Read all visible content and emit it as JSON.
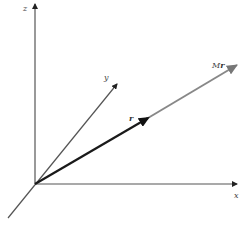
{
  "diagram": {
    "title": "",
    "origin": [
      35,
      184
    ],
    "axes": [
      {
        "name": "z",
        "label": "z",
        "from": [
          35,
          184
        ],
        "to": [
          35,
          3
        ],
        "label_pos": [
          23,
          11
        ],
        "color": "#555555"
      },
      {
        "name": "x",
        "label": "x",
        "from": [
          35,
          184
        ],
        "to": [
          238,
          184
        ],
        "label_pos": [
          234,
          197
        ],
        "color": "#555555"
      },
      {
        "name": "y",
        "label": "y",
        "from": [
          8,
          218
        ],
        "to": [
          118,
          83
        ],
        "label_pos": [
          104,
          80
        ],
        "color": "#555555"
      }
    ],
    "vectors": [
      {
        "name": "r",
        "label": "r",
        "from": [
          35,
          184
        ],
        "to": [
          150,
          117
        ],
        "label_pos": [
          128,
          120
        ],
        "color": "#1a1a1a",
        "width": 2.2
      },
      {
        "name": "Mr",
        "label_M": "M",
        "label_r": "r",
        "from": [
          150,
          117
        ],
        "to": [
          239,
          64
        ],
        "label_pos": [
          214,
          67
        ],
        "color": "#888888",
        "width": 2
      }
    ]
  }
}
